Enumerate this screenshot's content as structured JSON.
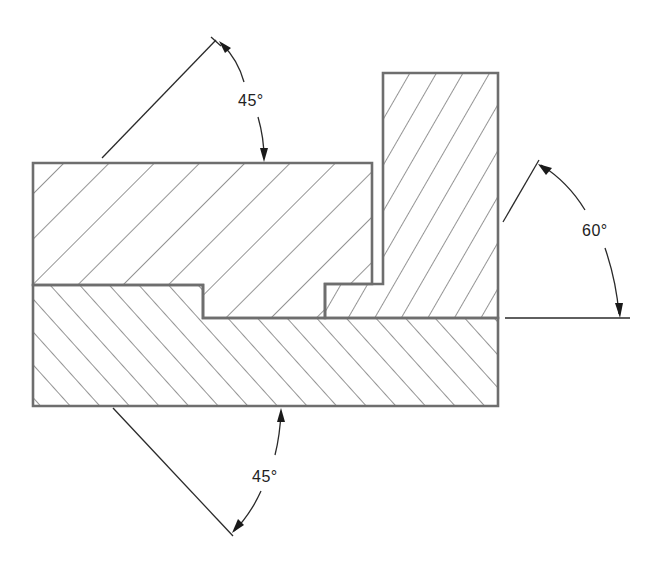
{
  "diagram": {
    "type": "section view with hatching",
    "parts": [
      {
        "id": "upper-block",
        "hatch_angle_deg": 45,
        "hatch_direction": "up-right"
      },
      {
        "id": "vertical-block",
        "hatch_angle_deg": 60,
        "hatch_direction": "up-right"
      },
      {
        "id": "base-block",
        "hatch_angle_deg": 45,
        "hatch_direction": "down-right"
      }
    ],
    "annotations": {
      "top_angle": {
        "label": "45°",
        "value": 45,
        "unit": "deg"
      },
      "right_angle": {
        "label": "60°",
        "value": 60,
        "unit": "deg"
      },
      "bottom_angle": {
        "label": "45°",
        "value": 45,
        "unit": "deg"
      }
    },
    "colors": {
      "outline": "#6e6e6e",
      "hatch": "#7a7a7a",
      "dimension": "#2a2a2a",
      "background": "#ffffff"
    }
  }
}
